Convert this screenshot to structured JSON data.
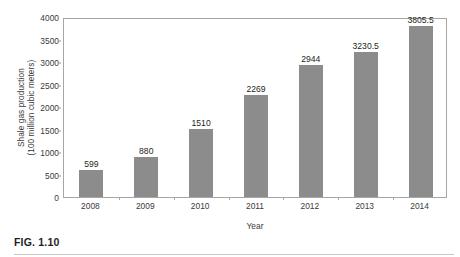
{
  "figure": {
    "caption": "FIG. 1.10"
  },
  "chart_data": {
    "type": "bar",
    "title": "",
    "xlabel": "Year",
    "ylabel": "Shale gas production\n(100 million cubic meters)",
    "categories": [
      "2008",
      "2009",
      "2010",
      "2011",
      "2012",
      "2013",
      "2014"
    ],
    "values": [
      599,
      880,
      1510,
      2269,
      2944,
      3230.5,
      3805.5
    ],
    "value_labels": [
      "599",
      "880",
      "1510",
      "2269",
      "2944",
      "3230.5",
      "3805.5"
    ],
    "ylim": [
      0,
      4000
    ],
    "ytick_labels": [
      "0",
      "500",
      "1000",
      "1500",
      "2000",
      "2500",
      "3000",
      "3500",
      "4000"
    ],
    "ytick_values": [
      0,
      500,
      1000,
      1500,
      2000,
      2500,
      3000,
      3500,
      4000
    ],
    "grid": false,
    "legend": null,
    "bar_color": "#8c8c8c",
    "axis_color": "#a6a6a6",
    "text_color": "#3a3a3a"
  }
}
